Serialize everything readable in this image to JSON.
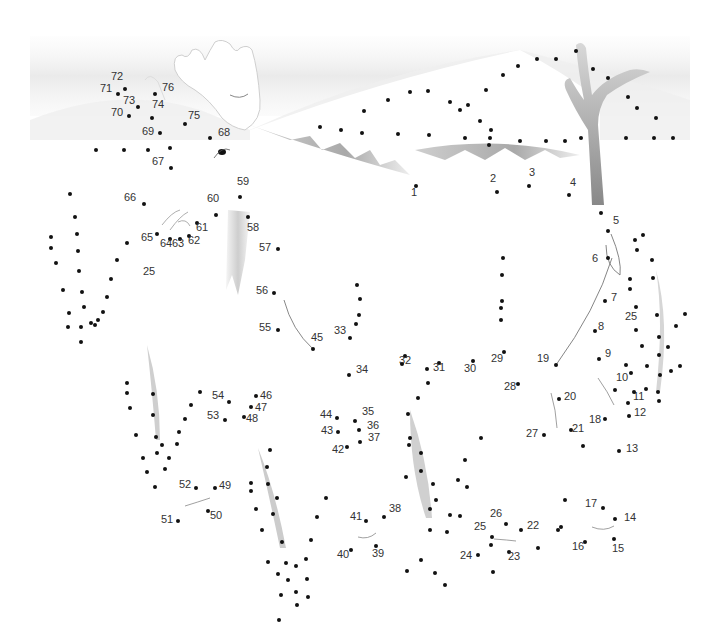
{
  "puzzle": {
    "title": "Connect the dots: moose in winter landscape",
    "colors": {
      "dot": "#111111",
      "label": "#333333",
      "sky": "#efefef",
      "tree": "#9a9a9a",
      "grass": "#bdbdbd"
    },
    "numbered_dots": [
      {
        "n": "1",
        "x": 416,
        "y": 186,
        "lx": 411,
        "ly": 192
      },
      {
        "n": "2",
        "x": 497,
        "y": 192,
        "lx": 490,
        "ly": 178
      },
      {
        "n": "3",
        "x": 529,
        "y": 186,
        "lx": 529,
        "ly": 172
      },
      {
        "n": "4",
        "x": 569,
        "y": 195,
        "lx": 570,
        "ly": 182
      },
      {
        "n": "5",
        "x": 608,
        "y": 231,
        "lx": 613,
        "ly": 220
      },
      {
        "n": "6",
        "x": 608,
        "y": 258,
        "lx": 592,
        "ly": 258
      },
      {
        "n": "7",
        "x": 605,
        "y": 301,
        "lx": 611,
        "ly": 297
      },
      {
        "n": "8",
        "x": 595,
        "y": 331,
        "lx": 598,
        "ly": 326
      },
      {
        "n": "9",
        "x": 599,
        "y": 359,
        "lx": 605,
        "ly": 353
      },
      {
        "n": "10",
        "x": 615,
        "y": 390,
        "lx": 616,
        "ly": 377
      },
      {
        "n": "11",
        "x": 628,
        "y": 403,
        "lx": 633,
        "ly": 396
      },
      {
        "n": "12",
        "x": 629,
        "y": 416,
        "lx": 634,
        "ly": 412
      },
      {
        "n": "13",
        "x": 619,
        "y": 451,
        "lx": 626,
        "ly": 448
      },
      {
        "n": "14",
        "x": 615,
        "y": 519,
        "lx": 624,
        "ly": 517
      },
      {
        "n": "15",
        "x": 614,
        "y": 539,
        "lx": 612,
        "ly": 548
      },
      {
        "n": "16",
        "x": 585,
        "y": 542,
        "lx": 572,
        "ly": 546
      },
      {
        "n": "17",
        "x": 603,
        "y": 508,
        "lx": 585,
        "ly": 503
      },
      {
        "n": "18",
        "x": 605,
        "y": 419,
        "lx": 589,
        "ly": 419
      },
      {
        "n": "19",
        "x": 556,
        "y": 365,
        "lx": 537,
        "ly": 358
      },
      {
        "n": "20",
        "x": 559,
        "y": 399,
        "lx": 564,
        "ly": 396
      },
      {
        "n": "21",
        "x": 571,
        "y": 430,
        "lx": 572,
        "ly": 428
      },
      {
        "n": "22",
        "x": 521,
        "y": 530,
        "lx": 527,
        "ly": 525
      },
      {
        "n": "23",
        "x": 509,
        "y": 552,
        "lx": 508,
        "ly": 556
      },
      {
        "n": "24",
        "x": 478,
        "y": 555,
        "lx": 460,
        "ly": 555
      },
      {
        "n": "25",
        "x": 492,
        "y": 537,
        "lx": 474,
        "ly": 526
      },
      {
        "n": "26",
        "x": 506,
        "y": 524,
        "lx": 490,
        "ly": 513
      },
      {
        "n": "27",
        "x": 544,
        "y": 435,
        "lx": 526,
        "ly": 433
      },
      {
        "n": "28",
        "x": 518,
        "y": 384,
        "lx": 504,
        "ly": 386
      },
      {
        "n": "29",
        "x": 504,
        "y": 352,
        "lx": 491,
        "ly": 358
      },
      {
        "n": "30",
        "x": 473,
        "y": 361,
        "lx": 464,
        "ly": 368
      },
      {
        "n": "31",
        "x": 439,
        "y": 363,
        "lx": 433,
        "ly": 367
      },
      {
        "n": "32",
        "x": 405,
        "y": 356,
        "lx": 399,
        "ly": 360
      },
      {
        "n": "33",
        "x": 350,
        "y": 338,
        "lx": 334,
        "ly": 330
      },
      {
        "n": "34",
        "x": 349,
        "y": 375,
        "lx": 356,
        "ly": 369
      },
      {
        "n": "35",
        "x": 355,
        "y": 421,
        "lx": 362,
        "ly": 411
      },
      {
        "n": "36",
        "x": 359,
        "y": 430,
        "lx": 367,
        "ly": 425
      },
      {
        "n": "37",
        "x": 360,
        "y": 442,
        "lx": 368,
        "ly": 437
      },
      {
        "n": "38",
        "x": 384,
        "y": 517,
        "lx": 389,
        "ly": 508
      },
      {
        "n": "39",
        "x": 376,
        "y": 546,
        "lx": 372,
        "ly": 553
      },
      {
        "n": "40",
        "x": 351,
        "y": 550,
        "lx": 337,
        "ly": 554
      },
      {
        "n": "41",
        "x": 366,
        "y": 521,
        "lx": 350,
        "ly": 516
      },
      {
        "n": "42",
        "x": 347,
        "y": 447,
        "lx": 332,
        "ly": 449
      },
      {
        "n": "43",
        "x": 338,
        "y": 432,
        "lx": 321,
        "ly": 430
      },
      {
        "n": "44",
        "x": 337,
        "y": 418,
        "lx": 320,
        "ly": 414
      },
      {
        "n": "45",
        "x": 313,
        "y": 349,
        "lx": 311,
        "ly": 337
      },
      {
        "n": "46",
        "x": 256,
        "y": 396,
        "lx": 260,
        "ly": 395
      },
      {
        "n": "47",
        "x": 251,
        "y": 407,
        "lx": 255,
        "ly": 407
      },
      {
        "n": "48",
        "x": 244,
        "y": 417,
        "lx": 246,
        "ly": 418
      },
      {
        "n": "49",
        "x": 215,
        "y": 488,
        "lx": 219,
        "ly": 485
      },
      {
        "n": "50",
        "x": 208,
        "y": 511,
        "lx": 210,
        "ly": 515
      },
      {
        "n": "51",
        "x": 178,
        "y": 521,
        "lx": 161,
        "ly": 519
      },
      {
        "n": "52",
        "x": 196,
        "y": 488,
        "lx": 179,
        "ly": 484
      },
      {
        "n": "53",
        "x": 225,
        "y": 420,
        "lx": 207,
        "ly": 415
      },
      {
        "n": "54",
        "x": 229,
        "y": 402,
        "lx": 212,
        "ly": 395
      },
      {
        "n": "55",
        "x": 278,
        "y": 330,
        "lx": 259,
        "ly": 327
      },
      {
        "n": "56",
        "x": 274,
        "y": 293,
        "lx": 256,
        "ly": 290
      },
      {
        "n": "57",
        "x": 278,
        "y": 249,
        "lx": 259,
        "ly": 247
      },
      {
        "n": "58",
        "x": 248,
        "y": 217,
        "lx": 247,
        "ly": 227
      },
      {
        "n": "59",
        "x": 240,
        "y": 197,
        "lx": 237,
        "ly": 181
      },
      {
        "n": "60",
        "x": 216,
        "y": 215,
        "lx": 207,
        "ly": 198
      },
      {
        "n": "61",
        "x": 197,
        "y": 223,
        "lx": 196,
        "ly": 227
      },
      {
        "n": "62",
        "x": 189,
        "y": 236,
        "lx": 188,
        "ly": 240
      },
      {
        "n": "63",
        "x": 180,
        "y": 239,
        "lx": 172,
        "ly": 243
      },
      {
        "n": "64",
        "x": 170,
        "y": 239,
        "lx": 160,
        "ly": 243
      },
      {
        "n": "65",
        "x": 157,
        "y": 234,
        "lx": 141,
        "ly": 237
      },
      {
        "n": "66",
        "x": 144,
        "y": 204,
        "lx": 124,
        "ly": 197
      },
      {
        "n": "67",
        "x": 171,
        "y": 168,
        "lx": 152,
        "ly": 161
      },
      {
        "n": "68",
        "x": 210,
        "y": 138,
        "lx": 218,
        "ly": 132
      },
      {
        "n": "69",
        "x": 160,
        "y": 133,
        "lx": 142,
        "ly": 131
      },
      {
        "n": "70",
        "x": 129,
        "y": 116,
        "lx": 111,
        "ly": 112
      },
      {
        "n": "71",
        "x": 118,
        "y": 94,
        "lx": 100,
        "ly": 88
      },
      {
        "n": "72",
        "x": 125,
        "y": 89,
        "lx": 111,
        "ly": 76
      },
      {
        "n": "73",
        "x": 138,
        "y": 107,
        "lx": 123,
        "ly": 100
      },
      {
        "n": "74",
        "x": 152,
        "y": 118,
        "lx": 152,
        "ly": 104
      },
      {
        "n": "75",
        "x": 185,
        "y": 124,
        "lx": 188,
        "ly": 115
      },
      {
        "n": "76",
        "x": 155,
        "y": 94,
        "lx": 162,
        "ly": 87
      }
    ],
    "extra_labels": [
      {
        "text": "25",
        "lx": 143,
        "ly": 271
      },
      {
        "text": "25",
        "lx": 625,
        "ly": 316
      }
    ],
    "unnumbered_dots": [
      [
        96,
        150
      ],
      [
        124,
        150
      ],
      [
        148,
        150
      ],
      [
        170,
        148
      ],
      [
        320,
        127
      ],
      [
        341,
        130
      ],
      [
        362,
        133
      ],
      [
        398,
        134
      ],
      [
        429,
        135
      ],
      [
        465,
        138
      ],
      [
        490,
        138
      ],
      [
        520,
        141
      ],
      [
        546,
        141
      ],
      [
        565,
        141
      ],
      [
        581,
        138
      ],
      [
        626,
        138
      ],
      [
        654,
        138
      ],
      [
        673,
        138
      ],
      [
        364,
        111
      ],
      [
        388,
        100
      ],
      [
        428,
        91
      ],
      [
        410,
        92
      ],
      [
        450,
        102
      ],
      [
        460,
        110
      ],
      [
        468,
        105
      ],
      [
        486,
        90
      ],
      [
        503,
        75
      ],
      [
        518,
        66
      ],
      [
        537,
        59
      ],
      [
        556,
        59
      ],
      [
        576,
        51
      ],
      [
        593,
        69
      ],
      [
        608,
        78
      ],
      [
        628,
        97
      ],
      [
        637,
        108
      ],
      [
        656,
        118
      ],
      [
        480,
        121
      ],
      [
        491,
        130
      ],
      [
        489,
        145
      ],
      [
        70,
        194
      ],
      [
        75,
        217
      ],
      [
        77,
        234
      ],
      [
        51,
        237
      ],
      [
        51,
        248
      ],
      [
        56,
        263
      ],
      [
        78,
        251
      ],
      [
        79,
        271
      ],
      [
        63,
        290
      ],
      [
        82,
        292
      ],
      [
        84,
        307
      ],
      [
        69,
        313
      ],
      [
        68,
        327
      ],
      [
        81,
        327
      ],
      [
        91,
        323
      ],
      [
        81,
        342
      ],
      [
        127,
        243
      ],
      [
        117,
        260
      ],
      [
        111,
        279
      ],
      [
        107,
        297
      ],
      [
        103,
        312
      ],
      [
        98,
        320
      ],
      [
        95,
        325
      ],
      [
        127,
        383
      ],
      [
        127,
        393
      ],
      [
        130,
        408
      ],
      [
        153,
        394
      ],
      [
        153,
        415
      ],
      [
        136,
        435
      ],
      [
        156,
        437
      ],
      [
        157,
        453
      ],
      [
        169,
        458
      ],
      [
        143,
        458
      ],
      [
        165,
        469
      ],
      [
        147,
        472
      ],
      [
        155,
        487
      ],
      [
        200,
        392
      ],
      [
        191,
        405
      ],
      [
        185,
        419
      ],
      [
        179,
        432
      ],
      [
        177,
        444
      ],
      [
        162,
        445
      ],
      [
        270,
        450
      ],
      [
        267,
        467
      ],
      [
        268,
        484
      ],
      [
        277,
        498
      ],
      [
        273,
        514
      ],
      [
        251,
        483
      ],
      [
        251,
        491
      ],
      [
        256,
        509
      ],
      [
        262,
        530
      ],
      [
        282,
        542
      ],
      [
        286,
        563
      ],
      [
        268,
        562
      ],
      [
        278,
        574
      ],
      [
        296,
        566
      ],
      [
        307,
        579
      ],
      [
        288,
        580
      ],
      [
        296,
        592
      ],
      [
        308,
        597
      ],
      [
        297,
        605
      ],
      [
        281,
        595
      ],
      [
        279,
        620
      ],
      [
        326,
        498
      ],
      [
        317,
        517
      ],
      [
        311,
        540
      ],
      [
        306,
        559
      ],
      [
        402,
        364
      ],
      [
        427,
        369
      ],
      [
        428,
        383
      ],
      [
        418,
        398
      ],
      [
        408,
        414
      ],
      [
        410,
        438
      ],
      [
        409,
        445
      ],
      [
        406,
        477
      ],
      [
        421,
        453
      ],
      [
        421,
        471
      ],
      [
        430,
        509
      ],
      [
        433,
        484
      ],
      [
        436,
        500
      ],
      [
        430,
        530
      ],
      [
        447,
        532
      ],
      [
        460,
        516
      ],
      [
        467,
        487
      ],
      [
        450,
        515
      ],
      [
        481,
        438
      ],
      [
        465,
        460
      ],
      [
        458,
        480
      ],
      [
        503,
        258
      ],
      [
        502,
        275
      ],
      [
        502,
        301
      ],
      [
        501,
        308
      ],
      [
        501,
        320
      ],
      [
        357,
        285
      ],
      [
        360,
        299
      ],
      [
        359,
        315
      ],
      [
        356,
        324
      ],
      [
        435,
        573
      ],
      [
        421,
        560
      ],
      [
        407,
        571
      ],
      [
        445,
        585
      ],
      [
        491,
        545
      ],
      [
        493,
        572
      ],
      [
        538,
        548
      ],
      [
        565,
        500
      ],
      [
        561,
        527
      ],
      [
        583,
        446
      ],
      [
        558,
        530
      ],
      [
        601,
        213
      ],
      [
        635,
        240
      ],
      [
        643,
        235
      ],
      [
        637,
        250
      ],
      [
        652,
        260
      ],
      [
        653,
        278
      ],
      [
        630,
        279
      ],
      [
        630,
        289
      ],
      [
        636,
        307
      ],
      [
        657,
        315
      ],
      [
        659,
        337
      ],
      [
        636,
        330
      ],
      [
        659,
        355
      ],
      [
        660,
        375
      ],
      [
        658,
        392
      ],
      [
        642,
        346
      ],
      [
        626,
        365
      ],
      [
        647,
        366
      ],
      [
        668,
        347
      ],
      [
        676,
        326
      ],
      [
        685,
        314
      ],
      [
        671,
        371
      ],
      [
        680,
        366
      ],
      [
        646,
        389
      ],
      [
        634,
        392
      ],
      [
        631,
        373
      ],
      [
        659,
        401
      ]
    ]
  }
}
